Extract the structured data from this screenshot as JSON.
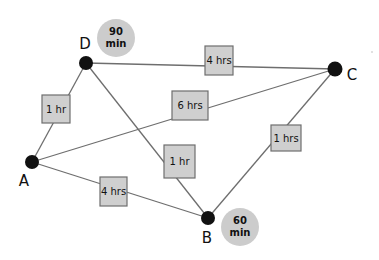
{
  "colors": {
    "edge": "#6e6e6e",
    "node": "#111111",
    "box_fill": "#cfcfcf",
    "box_stroke": "#6e6e6e",
    "wait_fill": "#cccccc"
  },
  "nodes": [
    {
      "id": "D",
      "label": "D",
      "x": 86,
      "y": 63
    },
    {
      "id": "C",
      "label": "C",
      "x": 335,
      "y": 69
    },
    {
      "id": "A",
      "label": "A",
      "x": 32,
      "y": 162
    },
    {
      "id": "B",
      "label": "B",
      "x": 208,
      "y": 218
    }
  ],
  "edges": [
    {
      "from": "D",
      "to": "A",
      "label": "1 hr"
    },
    {
      "from": "D",
      "to": "C",
      "label": "4 hrs"
    },
    {
      "from": "A",
      "to": "C",
      "label": "6 hrs"
    },
    {
      "from": "D",
      "to": "B",
      "label": "1 hr"
    },
    {
      "from": "C",
      "to": "B",
      "label": "1 hrs"
    },
    {
      "from": "A",
      "to": "B",
      "label": "4 hrs"
    }
  ],
  "wait_times": [
    {
      "node": "D",
      "line1": "90",
      "line2": "min"
    },
    {
      "node": "B",
      "line1": "60",
      "line2": "min"
    }
  ]
}
